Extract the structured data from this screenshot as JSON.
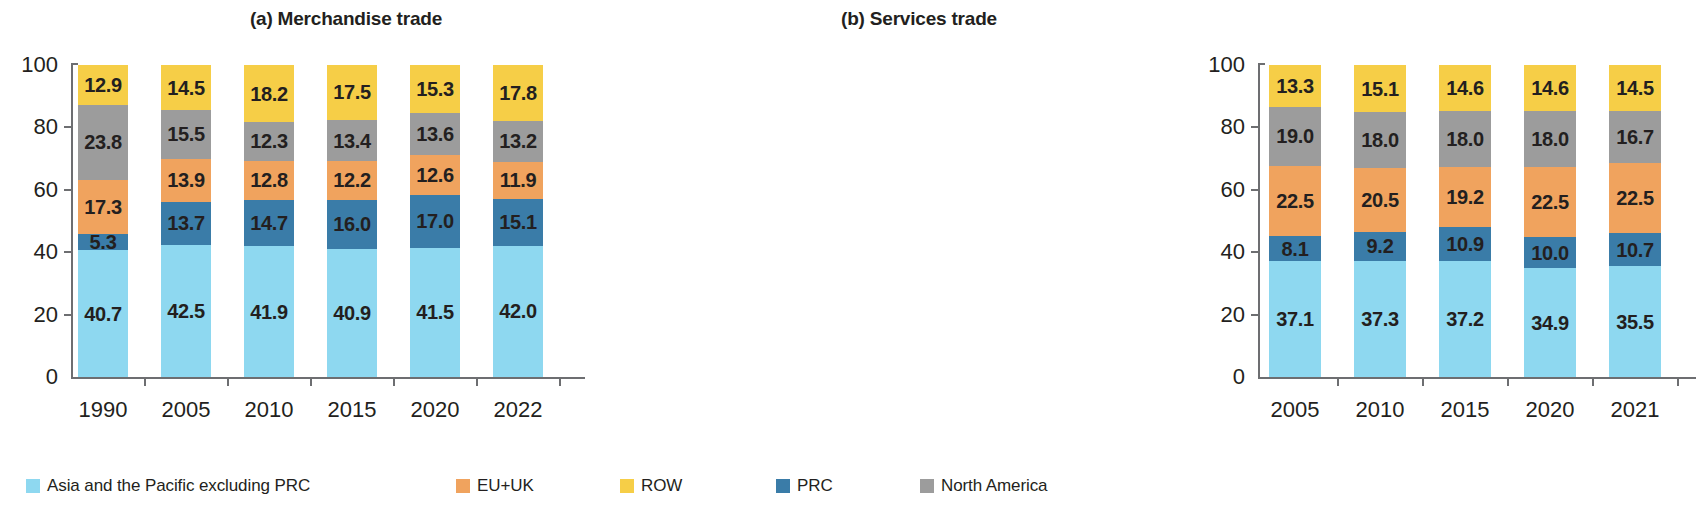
{
  "figure": {
    "width": 1174,
    "height": 506
  },
  "legend": {
    "items": [
      {
        "label": "Asia and the Pacific excluding PRC",
        "color": "#8ED8F0",
        "key": "ap_ex_prc",
        "left": 26
      },
      {
        "label": "EU+UK",
        "color": "#F0A35E",
        "key": "eu_uk",
        "left": 456
      },
      {
        "label": "ROW",
        "color": "#F6CE47",
        "key": "row",
        "left": 620
      },
      {
        "label": "PRC",
        "color": "#3A7CA8",
        "key": "prc",
        "left": 776
      },
      {
        "label": "North America",
        "color": "#9C9C9C",
        "key": "north_america",
        "left": 920
      }
    ]
  },
  "axis": {
    "yticks": [
      0,
      20,
      40,
      60,
      80,
      100
    ],
    "ytick_labels": [
      "0",
      "20",
      "40",
      "60",
      "80",
      "100"
    ],
    "ylim": [
      0,
      100
    ]
  },
  "chart_data": [
    {
      "type": "bar",
      "stacked": true,
      "id": "merchandise-trade",
      "title": "(a) Merchandise trade",
      "xlabel": "",
      "ylabel": "",
      "ylim": [
        0,
        100
      ],
      "grid": false,
      "legend_position": "bottom",
      "categories": [
        "1990",
        "2005",
        "2010",
        "2015",
        "2020",
        "2022"
      ],
      "stack_order": [
        "ap_ex_prc",
        "prc",
        "eu_uk",
        "north_america",
        "row"
      ],
      "series": [
        {
          "name": "Asia and the Pacific excluding PRC",
          "key": "ap_ex_prc",
          "color": "#8ED8F0",
          "values": [
            40.7,
            42.5,
            41.9,
            40.9,
            41.5,
            42.0
          ]
        },
        {
          "name": "PRC",
          "key": "prc",
          "color": "#3A7CA8",
          "values": [
            5.3,
            13.7,
            14.7,
            16.0,
            17.0,
            15.1
          ]
        },
        {
          "name": "EU+UK",
          "key": "eu_uk",
          "color": "#F0A35E",
          "values": [
            17.3,
            13.9,
            12.8,
            12.2,
            12.6,
            11.9
          ]
        },
        {
          "name": "North America",
          "key": "north_america",
          "color": "#9C9C9C",
          "values": [
            23.8,
            15.5,
            12.3,
            13.4,
            13.6,
            13.2
          ]
        },
        {
          "name": "ROW",
          "key": "row",
          "color": "#F6CE47",
          "values": [
            12.9,
            14.5,
            18.2,
            17.5,
            15.3,
            17.8
          ]
        }
      ],
      "labels": {
        "ap_ex_prc": [
          "40.7",
          "42.5",
          "41.9",
          "40.9",
          "41.5",
          "42.0"
        ],
        "prc": [
          "5.3",
          "13.7",
          "14.7",
          "16.0",
          "17.0",
          "15.1"
        ],
        "eu_uk": [
          "17.3",
          "13.9",
          "12.8",
          "12.2",
          "12.6",
          "11.9"
        ],
        "north_america": [
          "23.8",
          "15.5",
          "12.3",
          "13.4",
          "13.6",
          "13.2"
        ],
        "row": [
          "12.9",
          "14.5",
          "18.2",
          "17.5",
          "15.3",
          "17.8"
        ]
      }
    },
    {
      "type": "bar",
      "stacked": true,
      "id": "services-trade",
      "title": "(b) Services trade",
      "xlabel": "",
      "ylabel": "",
      "ylim": [
        0,
        100
      ],
      "grid": false,
      "legend_position": "bottom",
      "categories": [
        "2005",
        "2010",
        "2015",
        "2020",
        "2021"
      ],
      "stack_order": [
        "ap_ex_prc",
        "prc",
        "eu_uk",
        "north_america",
        "row"
      ],
      "series": [
        {
          "name": "Asia and the Pacific excluding PRC",
          "key": "ap_ex_prc",
          "color": "#8ED8F0",
          "values": [
            37.1,
            37.3,
            37.2,
            34.9,
            35.5
          ]
        },
        {
          "name": "PRC",
          "key": "prc",
          "color": "#3A7CA8",
          "values": [
            8.1,
            9.2,
            10.9,
            10.0,
            10.7
          ]
        },
        {
          "name": "EU+UK",
          "key": "eu_uk",
          "color": "#F0A35E",
          "values": [
            22.5,
            20.5,
            19.2,
            22.5,
            22.5
          ]
        },
        {
          "name": "North America",
          "key": "north_america",
          "color": "#9C9C9C",
          "values": [
            19.0,
            18.0,
            18.0,
            18.0,
            16.7
          ]
        },
        {
          "name": "ROW",
          "key": "row",
          "color": "#F6CE47",
          "values": [
            13.3,
            15.1,
            14.6,
            14.6,
            14.5
          ]
        }
      ],
      "labels": {
        "ap_ex_prc": [
          "37.1",
          "37.3",
          "37.2",
          "34.9",
          "35.5"
        ],
        "prc": [
          "8.1",
          "9.2",
          "10.9",
          "10.0",
          "10.7"
        ],
        "eu_uk": [
          "22.5",
          "20.5",
          "19.2",
          "22.5",
          "22.5"
        ],
        "north_america": [
          "19.0",
          "18.0",
          "18.0",
          "18.0",
          "16.7"
        ],
        "row": [
          "13.3",
          "15.1",
          "14.6",
          "14.6",
          "14.5"
        ]
      }
    }
  ]
}
